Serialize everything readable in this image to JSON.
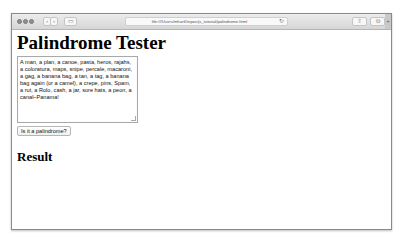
{
  "browser": {
    "url": "file:///Users/mhartl/repos/js_tutorial/palindrome.html",
    "back_icon": "‹",
    "forward_icon": "›",
    "sidebar_icon": "▭",
    "reload_icon": "↻",
    "share_icon": "⇧",
    "tabs_icon": "⧉",
    "new_tab_icon": "+"
  },
  "page": {
    "title": "Palindrome Tester",
    "textarea_value": "A man, a plan, a canoe, pasta, heros, rajahs, a coloratura, maps, snipe, percale, macaroni, a gag, a banana bag, a tan, a tag, a banana bag again (or a camel), a crepe, pins, Spam, a rut, a Rolo, cash, a jar, sore hats, a peon, a canal–Panama!",
    "button_label": "Is it a palindrome?",
    "result_heading": "Result"
  }
}
